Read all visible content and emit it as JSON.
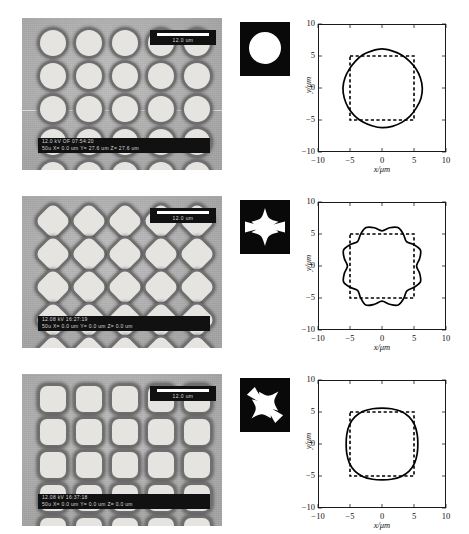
{
  "figure": {
    "panel_count": 3,
    "sem": {
      "grid_rows": 5,
      "grid_cols": 5,
      "background_color": "#b9b9b9",
      "feature_color": "#e6e4e0",
      "scalebar_label": "12.0 um",
      "info_line1_row1": "12.0 kV  OF  07:54:20",
      "info_line2_row1": "50u   X= 0.0  um Y= 27.6  um Z= 27.6  um",
      "info_line1_row2": "12.08 kV 16:27:19",
      "info_line2_row2": "50u   X= 0.0  um Y= 0.0  um Z= 0.0  um",
      "info_line1_row3": "12.08 kV 16:37:18",
      "info_line2_row3": "50u   X= 0.0  um Y= 0.0  um Z= 0.0  um"
    },
    "rows": [
      {
        "id": "row-circle",
        "sem_shape": "circle",
        "mask_shape": "circle",
        "mask_colors": {
          "background": "#090909",
          "foreground": "#ffffff"
        }
      },
      {
        "id": "row-diamond",
        "sem_shape": "diamond",
        "mask_shape": "cross-star",
        "mask_colors": {
          "background": "#090909",
          "foreground": "#ffffff"
        }
      },
      {
        "id": "row-rounded-square",
        "sem_shape": "rounded-square",
        "mask_shape": "diagonal-star",
        "mask_colors": {
          "background": "#090909",
          "foreground": "#ffffff"
        }
      }
    ]
  },
  "chart_data": [
    {
      "type": "line",
      "id": "chart-circle",
      "title": "",
      "xlabel": "x/μm",
      "ylabel": "y/μm",
      "xlim": [
        -10,
        10
      ],
      "ylim": [
        -10,
        10
      ],
      "xticks": [
        -10,
        -5,
        0,
        5,
        10
      ],
      "yticks": [
        -10,
        -5,
        0,
        5,
        10
      ],
      "xticklabels": [
        "-10",
        "-5",
        "0",
        "5",
        "10"
      ],
      "yticklabels": [
        "-10",
        "-5",
        "0",
        "5",
        "10"
      ],
      "grid": false,
      "legend": null,
      "series": [
        {
          "name": "measured profile",
          "style": "solid",
          "color": "#000000",
          "shape": "near-circle",
          "radius_mean": 6.0,
          "theta_deg": [
            0,
            15,
            30,
            45,
            60,
            75,
            90,
            105,
            120,
            135,
            150,
            165,
            180,
            195,
            210,
            225,
            240,
            255,
            270,
            285,
            300,
            315,
            330,
            345
          ],
          "r": [
            6.3,
            6.2,
            6.1,
            6.0,
            6.0,
            6.0,
            6.1,
            6.0,
            6.0,
            5.9,
            5.9,
            6.0,
            6.1,
            6.1,
            6.1,
            6.1,
            6.1,
            6.1,
            6.2,
            6.2,
            6.2,
            6.2,
            6.2,
            6.3
          ]
        },
        {
          "name": "design (mask) square",
          "style": "dashed",
          "color": "#000000",
          "shape": "square",
          "half_width": 5.0,
          "corners": [
            [
              -5,
              -5
            ],
            [
              5,
              -5
            ],
            [
              5,
              5
            ],
            [
              -5,
              5
            ]
          ]
        }
      ]
    },
    {
      "type": "line",
      "id": "chart-octagon-wavy",
      "title": "",
      "xlabel": "x/μm",
      "ylabel": "y/μm",
      "xlim": [
        -10,
        10
      ],
      "ylim": [
        -10,
        10
      ],
      "xticks": [
        -10,
        -5,
        0,
        5,
        10
      ],
      "yticks": [
        -10,
        -5,
        0,
        5,
        10
      ],
      "xticklabels": [
        "-10",
        "-5",
        "0",
        "5",
        "10"
      ],
      "yticklabels": [
        "-10",
        "-5",
        "0",
        "5",
        "10"
      ],
      "grid": false,
      "legend": null,
      "series": [
        {
          "name": "measured profile",
          "style": "solid",
          "color": "#000000",
          "shape": "wavy-octagon",
          "lobes": 8,
          "r_max": 6.6,
          "r_min": 5.3,
          "theta_deg": [
            0,
            11.25,
            22.5,
            33.75,
            45,
            56.25,
            67.5,
            78.75,
            90,
            101.25,
            112.5,
            123.75,
            135,
            146.25,
            157.5,
            168.75,
            180,
            191.25,
            202.5,
            213.75,
            225,
            236.25,
            247.5,
            258.75,
            270,
            281.25,
            292.5,
            303.75,
            315,
            326.25,
            337.5,
            348.75
          ],
          "r": [
            5.4,
            6.0,
            6.5,
            6.0,
            5.4,
            6.0,
            6.5,
            6.1,
            5.5,
            6.1,
            6.5,
            6.0,
            5.4,
            6.0,
            6.5,
            6.0,
            5.4,
            6.0,
            6.5,
            6.0,
            5.4,
            6.0,
            6.6,
            6.1,
            5.5,
            6.1,
            6.6,
            6.1,
            5.5,
            6.0,
            6.5,
            6.0
          ]
        },
        {
          "name": "design (mask) square",
          "style": "dashed",
          "color": "#000000",
          "shape": "square",
          "half_width": 5.0,
          "corners": [
            [
              -5,
              -5
            ],
            [
              5,
              -5
            ],
            [
              5,
              5
            ],
            [
              -5,
              5
            ]
          ]
        }
      ]
    },
    {
      "type": "line",
      "id": "chart-squircle",
      "title": "",
      "xlabel": "x/μm",
      "ylabel": "y/μm",
      "xlim": [
        -10,
        10
      ],
      "ylim": [
        -10,
        10
      ],
      "xticks": [
        -10,
        -5,
        0,
        5,
        10
      ],
      "yticks": [
        -10,
        -5,
        0,
        5,
        10
      ],
      "xticklabels": [
        "-10",
        "-5",
        "0",
        "5",
        "10"
      ],
      "yticklabels": [
        "-10",
        "-5",
        "0",
        "5",
        "10"
      ],
      "grid": false,
      "legend": null,
      "series": [
        {
          "name": "measured profile",
          "style": "solid",
          "color": "#000000",
          "shape": "superellipse",
          "exponent": 4.0,
          "half_width": 5.6,
          "theta_deg": [
            0,
            15,
            30,
            45,
            60,
            75,
            90,
            105,
            120,
            135,
            150,
            165,
            180,
            195,
            210,
            225,
            240,
            255,
            270,
            285,
            300,
            315,
            330,
            345
          ],
          "r": [
            5.6,
            5.7,
            5.9,
            6.0,
            5.9,
            5.7,
            5.6,
            5.7,
            5.9,
            6.0,
            5.9,
            5.7,
            5.6,
            5.7,
            5.9,
            6.0,
            5.9,
            5.7,
            5.6,
            5.7,
            5.9,
            6.0,
            5.9,
            5.7
          ]
        },
        {
          "name": "design (mask) square",
          "style": "dashed",
          "color": "#000000",
          "shape": "square",
          "half_width": 5.0,
          "corners": [
            [
              -5,
              -5
            ],
            [
              5,
              -5
            ],
            [
              5,
              5
            ],
            [
              -5,
              5
            ]
          ]
        }
      ]
    }
  ]
}
